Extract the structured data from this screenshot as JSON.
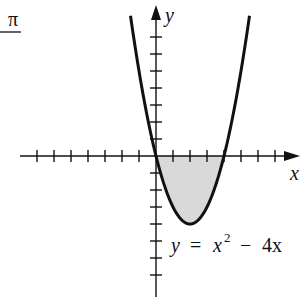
{
  "chart_data": {
    "type": "line",
    "title": "",
    "xlabel": "x",
    "ylabel": "y",
    "equation_label": "y = x² − 4x",
    "function": "x^2 - 4x",
    "x": [
      -1.5,
      -1,
      0,
      1,
      2,
      3,
      4,
      5,
      5.5
    ],
    "y": [
      8.25,
      5,
      0,
      -3,
      -4,
      -3,
      0,
      5,
      8.25
    ],
    "shaded_region": {
      "from_x": 0,
      "to_x": 4,
      "between": "curve and x-axis",
      "color": "#d9d9d9"
    },
    "vertex": [
      2,
      -4
    ],
    "x_intercepts": [
      0,
      4
    ],
    "xlim": [
      -7,
      8
    ],
    "ylim": [
      -8,
      9
    ],
    "grid": false,
    "tick_spacing": 1
  },
  "labels": {
    "x_axis": "x",
    "y_axis": "y",
    "equation_lhs": "y",
    "equation_eq": "=",
    "equation_x": "x",
    "equation_exp": "2",
    "equation_minus": "−",
    "equation_term": "4x",
    "corner_fragment": "π"
  }
}
